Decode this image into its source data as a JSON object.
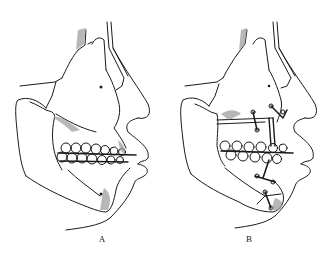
{
  "figure": {
    "panels": [
      {
        "id": "A",
        "label": "A",
        "description": "Lateral skull/face profile with mandible, teeth in occlusion wired with arch bars"
      },
      {
        "id": "B",
        "label": "B",
        "description": "Lateral skull/face profile after osteotomy with fixation plates and screws on maxilla and chin"
      }
    ]
  },
  "colors": {
    "line": "#1a1a1a",
    "shade": "#9a9a9a",
    "background": "#ffffff"
  }
}
